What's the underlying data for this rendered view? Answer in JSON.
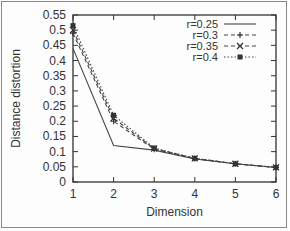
{
  "chart_data": {
    "type": "line",
    "title": "",
    "xlabel": "Dimension",
    "ylabel": "Distance distortion",
    "x": [
      1,
      2,
      3,
      4,
      5,
      6
    ],
    "xlim": [
      1,
      6
    ],
    "ylim": [
      0,
      0.55
    ],
    "xticks": [
      "1",
      "2",
      "3",
      "4",
      "5",
      "6"
    ],
    "yticks": [
      "0",
      "0.05",
      "0.1",
      "0.15",
      "0.2",
      "0.25",
      "0.3",
      "0.35",
      "0.4",
      "0.45",
      "0.5",
      "0.55"
    ],
    "grid": false,
    "legend_position": "top-right",
    "series": [
      {
        "name": "r=0.25",
        "style": "solid",
        "marker": "none",
        "values": [
          0.44,
          0.12,
          0.105,
          0.076,
          0.06,
          0.048
        ]
      },
      {
        "name": "r=0.3",
        "style": "dashed",
        "marker": "plus",
        "values": [
          0.49,
          0.2,
          0.108,
          0.077,
          0.06,
          0.048
        ]
      },
      {
        "name": "r=0.35",
        "style": "dashed",
        "marker": "cross",
        "values": [
          0.5,
          0.21,
          0.11,
          0.078,
          0.06,
          0.048
        ]
      },
      {
        "name": "r=0.4",
        "style": "dotted",
        "marker": "filled-square",
        "values": [
          0.515,
          0.22,
          0.112,
          0.078,
          0.06,
          0.048
        ]
      }
    ]
  }
}
